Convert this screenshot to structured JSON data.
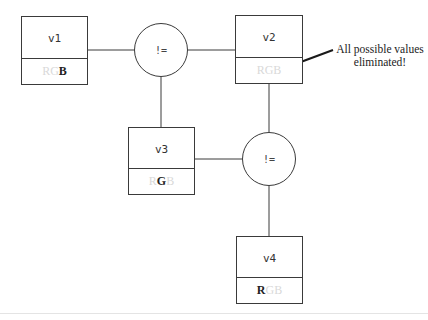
{
  "diagram": {
    "type": "constraint-graph",
    "variables": [
      {
        "id": "v1",
        "label": "v1",
        "domain": [
          {
            "value": "R",
            "active": false
          },
          {
            "value": "G",
            "active": false
          },
          {
            "value": "B",
            "active": true
          }
        ]
      },
      {
        "id": "v2",
        "label": "v2",
        "domain": [
          {
            "value": "R",
            "active": false
          },
          {
            "value": "G",
            "active": false
          },
          {
            "value": "B",
            "active": false
          }
        ]
      },
      {
        "id": "v3",
        "label": "v3",
        "domain": [
          {
            "value": "R",
            "active": false
          },
          {
            "value": "G",
            "active": true
          },
          {
            "value": "B",
            "active": false
          }
        ]
      },
      {
        "id": "v4",
        "label": "v4",
        "domain": [
          {
            "value": "R",
            "active": true
          },
          {
            "value": "G",
            "active": false
          },
          {
            "value": "B",
            "active": false
          }
        ]
      }
    ],
    "constraints": [
      {
        "id": "c1",
        "label": "!=",
        "connects": [
          "v1",
          "v2",
          "v3"
        ]
      },
      {
        "id": "c2",
        "label": "!=",
        "connects": [
          "v2",
          "v3",
          "v4"
        ]
      }
    ],
    "annotation": {
      "text_line1": "All possible values",
      "text_line2": "eliminated!",
      "points_to": "v2"
    },
    "colors": {
      "line": "#3a3a3a",
      "active_value": "#222222",
      "eliminated_value": "#d9d9d9"
    }
  }
}
